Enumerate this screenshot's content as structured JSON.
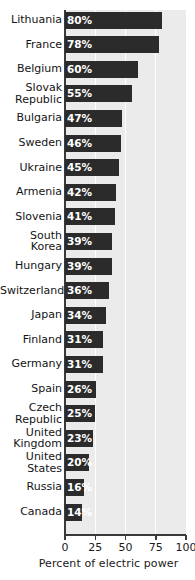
{
  "chart_data": {
    "type": "bar",
    "orientation": "horizontal",
    "title": "",
    "xlabel": "Percent of electric power",
    "ylabel": "",
    "xlim": [
      0,
      100
    ],
    "xticks": [
      0,
      25,
      50,
      75,
      100
    ],
    "xtick_labels": [
      "0",
      "25",
      "50",
      "75",
      "100"
    ],
    "grid": true,
    "grid_axis": "x",
    "legend": false,
    "value_label_suffix": "%",
    "categories": [
      "Lithuania",
      "France",
      "Belgium",
      "Slovak\nRepublic",
      "Bulgaria",
      "Sweden",
      "Ukraine",
      "Armenia",
      "Slovenia",
      "South\nKorea",
      "Hungary",
      "Switzerland",
      "Japan",
      "Finland",
      "Germany",
      "Spain",
      "Czech\nRepublic",
      "United\nKingdom",
      "United\nStates",
      "Russia",
      "Canada"
    ],
    "values": [
      80,
      78,
      60,
      55,
      47,
      46,
      45,
      42,
      41,
      39,
      39,
      36,
      34,
      31,
      31,
      26,
      25,
      23,
      20,
      16,
      14
    ],
    "value_labels": [
      "80%",
      "78%",
      "60%",
      "55%",
      "47%",
      "46%",
      "45%",
      "42%",
      "41%",
      "39%",
      "39%",
      "36%",
      "34%",
      "31%",
      "31%",
      "26%",
      "25%",
      "23%",
      "20%",
      "16%",
      "14%"
    ]
  },
  "colors": {
    "bar": "#2b2b2b",
    "plot_background": "#ebebeb",
    "gridline": "#ffffff",
    "axis": "#3a3a3a",
    "value_text": "#ffffff",
    "label_text": "#141414",
    "page_background": "#ffffff"
  }
}
